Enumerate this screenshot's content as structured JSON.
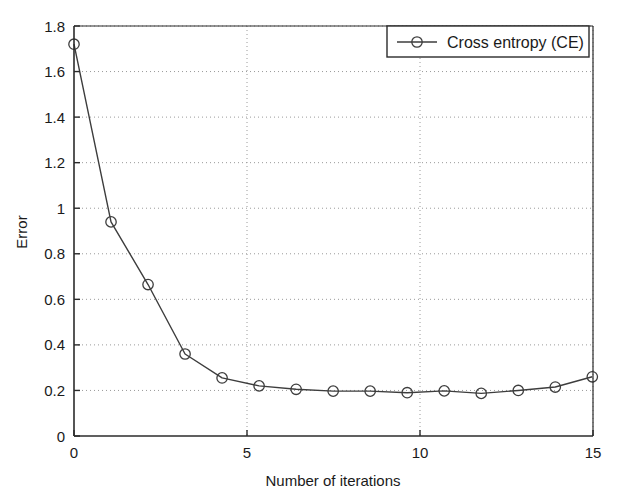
{
  "chart_data": {
    "type": "line",
    "title": "",
    "xlabel": "Number of iterations",
    "ylabel": "Error",
    "xlim": [
      0,
      15
    ],
    "ylim": [
      0,
      1.8
    ],
    "xticks": [
      0,
      5,
      10,
      15
    ],
    "xtick_labels": [
      "0",
      "5",
      "10",
      "15"
    ],
    "yticks": [
      0,
      0.2,
      0.4,
      0.6,
      0.8,
      1,
      1.2,
      1.4,
      1.6,
      1.8
    ],
    "ytick_labels": [
      "0",
      "0.2",
      "0.4",
      "0.6",
      "0.8",
      "1",
      "1.2",
      "1.4",
      "1.6",
      "1.8"
    ],
    "grid": true,
    "grid_style": "dotted",
    "legend_position": "top-right",
    "marker": "circle",
    "line_color": "#3d3d3d",
    "series": [
      {
        "name": "Cross entropy (CE)",
        "x": [
          0,
          1.07,
          2.14,
          3.21,
          4.28,
          5.35,
          6.42,
          7.49,
          8.56,
          9.63,
          10.7,
          11.77,
          12.84,
          13.91,
          14.98
        ],
        "values": [
          1.72,
          0.94,
          0.665,
          0.36,
          0.255,
          0.22,
          0.205,
          0.197,
          0.197,
          0.19,
          0.198,
          0.187,
          0.2,
          0.215,
          0.26
        ]
      }
    ]
  },
  "legend": {
    "entries": [
      {
        "label": "Cross entropy (CE)"
      }
    ]
  },
  "axes": {
    "x_title": "Number of iterations",
    "y_title": "Error"
  }
}
